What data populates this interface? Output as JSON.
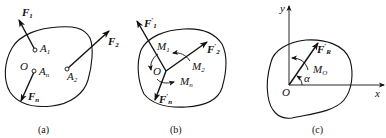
{
  "figure": {
    "panels": [
      {
        "id": "a",
        "caption": "(a)",
        "labels": {
          "F1": {
            "base": "F",
            "sub": "1"
          },
          "F2": {
            "base": "F",
            "sub": "2"
          },
          "Fn": {
            "base": "F",
            "sub": "n"
          },
          "O": "O",
          "A1": {
            "base": "A",
            "sub": "1"
          },
          "A2": {
            "base": "A",
            "sub": "2"
          },
          "An": {
            "base": "A",
            "sub": "n"
          }
        }
      },
      {
        "id": "b",
        "caption": "(b)",
        "labels": {
          "F1p": {
            "base": "F",
            "prime": "′",
            "sub": "1"
          },
          "F2p": {
            "base": "F",
            "prime": "′",
            "sub": "2"
          },
          "Fnp": {
            "base": "F",
            "prime": "′",
            "sub": "n"
          },
          "M1": {
            "base": "M",
            "sub": "1"
          },
          "M2": {
            "base": "M",
            "sub": "2"
          },
          "Mn": {
            "base": "M",
            "sub": "n"
          },
          "O": "O"
        }
      },
      {
        "id": "c",
        "caption": "(c)",
        "labels": {
          "y": "y",
          "x": "x",
          "O": "O",
          "FRp": {
            "base": "F",
            "prime": "′",
            "sub": "R"
          },
          "MO": {
            "base": "M",
            "sub": "O"
          },
          "alpha": "α"
        }
      }
    ],
    "colors": {
      "ink": "#111111",
      "background": "#ffffff"
    }
  }
}
